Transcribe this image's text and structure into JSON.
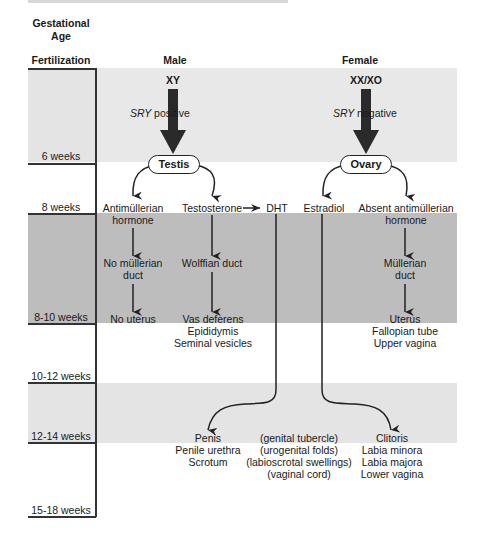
{
  "header": {
    "column_title_line1": "Gestational",
    "column_title_line2": "Age",
    "column_title_line3": "Fertilization",
    "male": "Male",
    "female": "Female"
  },
  "timeline": [
    {
      "label": "6 weeks"
    },
    {
      "label": "8 weeks"
    },
    {
      "label": "8-10 weeks"
    },
    {
      "label": "10-12 weeks"
    },
    {
      "label": "12-14 weeks"
    },
    {
      "label": "15-18 weeks"
    }
  ],
  "male": {
    "karyotype": "XY",
    "sry_prefix": "SRY",
    "sry_suffix": " positive",
    "gonad": "Testis",
    "amh_line1": "Antimüllerian",
    "amh_line2": "hormone",
    "no_mullerian_line1": "No müllerian",
    "no_mullerian_line2": "duct",
    "no_uterus": "No uterus",
    "testosterone": "Testosterone",
    "wolffian": "Wolffian duct",
    "wolffian_products": [
      "Vas deferens",
      "Epididymis",
      "Seminal vesicles"
    ],
    "dht": "DHT",
    "external": [
      "Penis",
      "Penile urethra",
      "Scrotum"
    ]
  },
  "female": {
    "karyotype": "XX/XO",
    "sry_prefix": "SRY",
    "sry_suffix": " negative",
    "gonad": "Ovary",
    "estradiol": "Estradiol",
    "absent_amh_line1": "Absent antimüllerian",
    "absent_amh_line2": "hormone",
    "mullerian_line1": "Müllerian",
    "mullerian_line2": "duct",
    "mullerian_products": [
      "Uterus",
      "Fallopian tube",
      "Upper vagina"
    ],
    "external": [
      "Clitoris",
      "Labia minora",
      "Labia majora",
      "Lower vagina"
    ]
  },
  "precursors": [
    "(genital tubercle)",
    "(urogenital folds)",
    "(labioscrotal swellings)",
    "(vaginal cord)"
  ],
  "colors": {
    "band_light": "#e4e4e4",
    "band_dark": "#bdbdbd",
    "arrow": "#222222"
  }
}
